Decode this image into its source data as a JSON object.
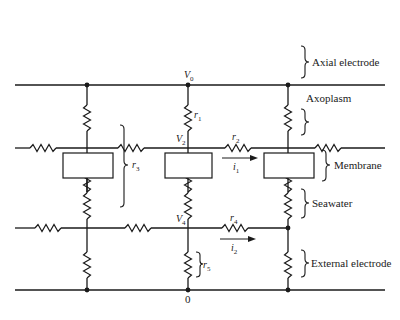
{
  "diagram": {
    "type": "circuit-schematic",
    "nodes": {
      "V0": {
        "symbol": "V",
        "subscript": "0"
      },
      "V2": {
        "symbol": "V",
        "subscript": "2"
      },
      "V4": {
        "symbol": "V",
        "subscript": "4"
      },
      "ground": {
        "label": "0"
      }
    },
    "resistors": {
      "r1": {
        "symbol": "r",
        "subscript": "1"
      },
      "r2": {
        "symbol": "r",
        "subscript": "2"
      },
      "r3": {
        "symbol": "r",
        "subscript": "3"
      },
      "r4": {
        "symbol": "r",
        "subscript": "4"
      },
      "r5": {
        "symbol": "r",
        "subscript": "5"
      }
    },
    "currents": {
      "i1": {
        "symbol": "i",
        "subscript": "1"
      },
      "i2": {
        "symbol": "i",
        "subscript": "2"
      }
    },
    "annotations": {
      "axial_electrode": "Axial electrode",
      "axoplasm": "Axoplasm",
      "membrane": "Membrane",
      "seawater": "Seawater",
      "external_electrode": "External electrode"
    },
    "colors": {
      "ink": "#1a1a1a",
      "background": "#ffffff"
    }
  }
}
